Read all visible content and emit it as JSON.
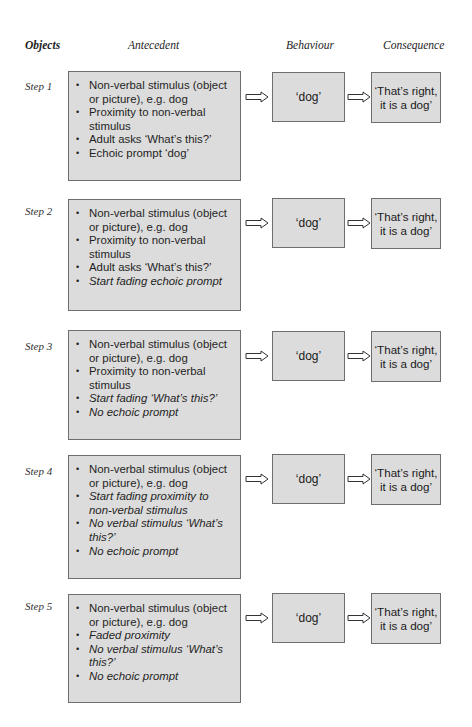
{
  "page": {
    "running_head": "TEACHING COMMUNICATION SKILLS",
    "page_number": "181"
  },
  "columns": {
    "objects": "Objects",
    "antecedent": "Antecedent",
    "behaviour": "Behaviour",
    "consequence": "Consequence"
  },
  "steps": [
    {
      "label": "Step 1",
      "antecedent": [
        {
          "text": "Non-verbal stimulus (object or picture), e.g. dog",
          "italic": false
        },
        {
          "text": "Proximity to non-verbal stimulus",
          "italic": false
        },
        {
          "text": "Adult asks ‘What’s this?’",
          "italic": false
        },
        {
          "text": "Echoic prompt ‘dog’",
          "italic": false
        }
      ],
      "behaviour": "‘dog’",
      "consequence": "‘That’s right, it is a dog’"
    },
    {
      "label": "Step 2",
      "antecedent": [
        {
          "text": "Non-verbal stimulus (object or picture), e.g. dog",
          "italic": false
        },
        {
          "text": "Proximity to non-verbal stimulus",
          "italic": false
        },
        {
          "text": "Adult asks ‘What’s this?’",
          "italic": false
        },
        {
          "text": "Start fading echoic prompt",
          "italic": true
        }
      ],
      "behaviour": "‘dog’",
      "consequence": "‘That’s right, it is a dog’"
    },
    {
      "label": "Step 3",
      "antecedent": [
        {
          "text": "Non-verbal stimulus (object or picture), e.g. dog",
          "italic": false
        },
        {
          "text": "Proximity to non-verbal stimulus",
          "italic": false
        },
        {
          "text": "Start fading ‘What’s this?’",
          "italic": true
        },
        {
          "text": "No echoic prompt",
          "italic": true
        }
      ],
      "behaviour": "‘dog’",
      "consequence": "‘That’s right, it is a dog’"
    },
    {
      "label": "Step 4",
      "antecedent": [
        {
          "text": "Non-verbal stimulus (object or picture), e.g. dog",
          "italic": false
        },
        {
          "text": "Start fading proximity to non-verbal stimulus",
          "italic": true
        },
        {
          "text": "No verbal stimulus ‘What’s this?’",
          "italic": true
        },
        {
          "text": "No echoic prompt",
          "italic": true
        }
      ],
      "behaviour": "‘dog’",
      "consequence": "‘That’s right, it is a dog’"
    },
    {
      "label": "Step 5",
      "antecedent": [
        {
          "text": "Non-verbal stimulus (object or picture), e.g. dog",
          "italic": false
        },
        {
          "text": "Faded proximity",
          "italic": true
        },
        {
          "text": "No verbal stimulus ‘What’s this?’",
          "italic": true
        },
        {
          "text": "No echoic prompt",
          "italic": true
        }
      ],
      "behaviour": "‘dog’",
      "consequence": "‘That’s right, it is a dog’"
    }
  ],
  "colors": {
    "box_fill": "#dcdcdc",
    "box_border": "#6e6e6e"
  }
}
